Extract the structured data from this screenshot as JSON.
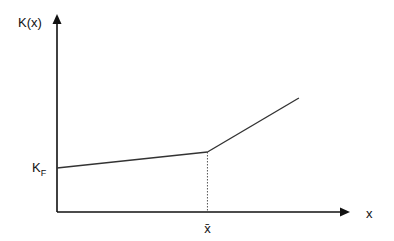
{
  "chart_data": {
    "type": "line",
    "title": "",
    "ylabel": "K(x)",
    "xlabel": "x",
    "intercept_label": "K",
    "intercept_label_subscript": "F",
    "kink_label": "x̄",
    "axis_color": "#111111",
    "line_color": "#333333",
    "xlim": [
      0,
      10
    ],
    "ylim": [
      0,
      10
    ],
    "series": [
      {
        "name": "K(x)",
        "points": [
          {
            "x": 0,
            "y": 2.2
          },
          {
            "x": 5.1,
            "y": 3.0
          },
          {
            "x": 8.2,
            "y": 5.7
          }
        ]
      }
    ],
    "kink_x": 5.1,
    "grid": false,
    "legend": "none"
  }
}
